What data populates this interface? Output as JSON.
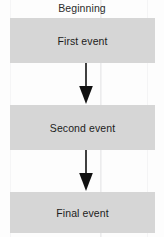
{
  "diagram": {
    "title": "Beginning",
    "type": "vertical-flowchart",
    "background_color": "#fdfdfd",
    "node_fill_color": "#d6d6d6",
    "text_color": "#1c1c1c",
    "arrow_color": "#111111",
    "nodes": [
      {
        "id": "node-1",
        "label": "First event"
      },
      {
        "id": "node-2",
        "label": "Second event"
      },
      {
        "id": "node-3",
        "label": "Final event"
      }
    ],
    "connectors": [
      {
        "id": "connector-1",
        "from": "node-1",
        "to": "node-2",
        "direction": "down",
        "style": "solid-arrow"
      },
      {
        "id": "connector-2",
        "from": "node-2",
        "to": "node-3",
        "direction": "down",
        "style": "solid-arrow"
      }
    ]
  }
}
